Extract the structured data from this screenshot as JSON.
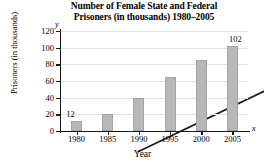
{
  "chart_data": {
    "type": "bar",
    "title": "Number of Female State and Federal Prisoners (in thousands) 1980–2005",
    "title_line1": "Number of Female State and Federal",
    "title_line2": "Prisoners (in thousands) 1980–2005",
    "xlabel": "Year",
    "ylabel": "Prisoners (in thousands)",
    "x_axis_letter": "x",
    "y_axis_letter": "y",
    "categories": [
      "1980",
      "1985",
      "1990",
      "1995",
      "2000",
      "2005"
    ],
    "values": [
      12,
      21,
      40,
      65,
      85,
      102
    ],
    "point_labels": [
      {
        "category": "1980",
        "label": "12"
      },
      {
        "category": "2005",
        "label": "102"
      }
    ],
    "yticks": [
      0,
      20,
      40,
      60,
      80,
      100,
      120
    ],
    "ylim": [
      0,
      120
    ],
    "grid": true,
    "legend": "none",
    "series": [
      {
        "name": "Female prisoners",
        "values": [
          12,
          21,
          40,
          65,
          85,
          102
        ]
      },
      {
        "name": "Trend line",
        "type": "line",
        "points": [
          {
            "x": "1980",
            "y": 12
          },
          {
            "x": "2005",
            "y": 102
          }
        ]
      }
    ],
    "colors": {
      "bar": "#b8b8b8",
      "bar_border": "#a4a4a4",
      "trendline": "#1a1a1a",
      "gridline": "#e2e2e2",
      "axis": "#1a1a1a"
    }
  }
}
